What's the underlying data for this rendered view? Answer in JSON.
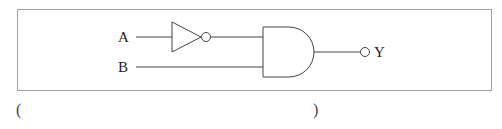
{
  "diagram": {
    "type": "logic-circuit",
    "inputs": [
      {
        "label": "A"
      },
      {
        "label": "B"
      }
    ],
    "gates": [
      {
        "type": "NOT",
        "input": "A"
      },
      {
        "type": "AND",
        "inputs": [
          "NOT A",
          "B"
        ],
        "output_inverted": true
      }
    ],
    "output": {
      "label": "Y"
    },
    "colors": {
      "stroke": "#444444",
      "frame": "#999999"
    }
  },
  "answer_blank": {
    "open": "(",
    "close": ")"
  }
}
